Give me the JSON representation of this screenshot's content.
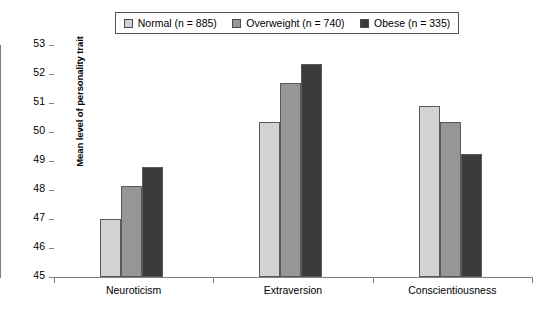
{
  "chart_data": {
    "type": "bar",
    "title": "",
    "xlabel": "",
    "ylabel": "Mean level of personality trait",
    "categories": [
      "Neuroticism",
      "Extraversion",
      "Conscientiousness"
    ],
    "series": [
      {
        "name": "Normal (n = 885)",
        "color": "#d2d2d2",
        "values": [
          47.0,
          50.35,
          50.9
        ]
      },
      {
        "name": "Overweight (n = 740)",
        "color": "#969696",
        "values": [
          48.15,
          51.7,
          50.35
        ]
      },
      {
        "name": "Obese (n = 335)",
        "color": "#3b3b3b",
        "values": [
          48.8,
          52.35,
          49.25
        ]
      }
    ],
    "ylim": [
      45,
      53
    ],
    "yticks": [
      45,
      46,
      47,
      48,
      49,
      50,
      51,
      52,
      53
    ],
    "ytick_labels": [
      "45",
      "46",
      "47",
      "48",
      "49",
      "50",
      "51",
      "52",
      "53"
    ],
    "grid": false,
    "legend_position": "top"
  },
  "legend": {
    "entries": [
      {
        "label": "Normal (n = 885)",
        "swatch": "legend-swatch-normal"
      },
      {
        "label": "Overweight (n = 740)",
        "swatch": "legend-swatch-overweight"
      },
      {
        "label": "Obese (n = 335)",
        "swatch": "legend-swatch-obese"
      }
    ]
  }
}
